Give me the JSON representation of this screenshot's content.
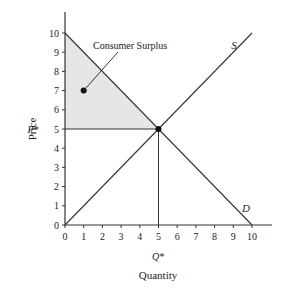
{
  "chart_data": {
    "type": "line",
    "title": "",
    "xlabel": "Quantity",
    "ylabel": "Price",
    "xlim": [
      0,
      10
    ],
    "ylim": [
      0,
      10
    ],
    "x_ticks": [
      "0",
      "1",
      "2",
      "3",
      "4",
      "5",
      "6",
      "7",
      "8",
      "9",
      "10"
    ],
    "y_ticks": [
      "0",
      "1",
      "2",
      "3",
      "4",
      "5",
      "6",
      "7",
      "8",
      "9",
      "10"
    ],
    "grid": false,
    "series": [
      {
        "name": "S",
        "label": "S",
        "points": [
          [
            0,
            0
          ],
          [
            10,
            10
          ]
        ]
      },
      {
        "name": "D",
        "label": "D",
        "points": [
          [
            0,
            10
          ],
          [
            10,
            0
          ]
        ]
      }
    ],
    "equilibrium": {
      "x": 5,
      "y": 5,
      "price_label": "P*",
      "quantity_label": "Q*"
    },
    "shaded_region": {
      "name": "Consumer Surplus",
      "points": [
        [
          0,
          10
        ],
        [
          5,
          5
        ],
        [
          0,
          5
        ]
      ],
      "color": "#e6e6e6"
    },
    "annotations": [
      {
        "text": "Consumer Surplus",
        "point": [
          1,
          7
        ]
      }
    ]
  },
  "labels": {
    "ylabel": "Price",
    "xlabel": "Quantity",
    "p_star": "P*",
    "q_star": "Q*",
    "supply": "S",
    "demand": "D",
    "consumer_surplus": "Consumer Surplus"
  },
  "colors": {
    "line": "#333333",
    "shade": "#e6e6e6",
    "text": "#222222"
  }
}
